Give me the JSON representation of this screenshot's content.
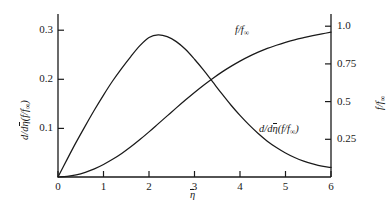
{
  "figure": {
    "background_color": "#ffffff",
    "line_color": "#1a1a1a",
    "axis_color": "#1a1a1a"
  },
  "axes": {
    "x": {
      "label_main": "η",
      "label_full": "η̄",
      "ticks": [
        "0",
        "1",
        "2",
        "3",
        "4",
        "5",
        "6"
      ],
      "min": 0,
      "max": 6
    },
    "y_left": {
      "label_prefix": "d/d",
      "label_eta": "η",
      "label_suffix": "(f/f",
      "label_sub": "∞",
      "label_close": ")",
      "label_full": "d/dη̄(f/f∞)",
      "ticks": [
        "0.1",
        "0.2",
        "0.3"
      ],
      "min": 0,
      "max": 0.36
    },
    "y_right": {
      "label_num": "f",
      "label_den": "f",
      "label_sub": "∞",
      "label_full": "f/f∞",
      "ticks": [
        "0.25",
        "0.5",
        "0.75",
        "1.0"
      ],
      "min": 0,
      "max": 1.08
    }
  },
  "curve_labels": {
    "f_over_finf": "f/f∞",
    "derivative": "d/dη̄(f/f∞)"
  },
  "chart_data": {
    "type": "line",
    "title": "",
    "xlabel": "η̄",
    "ylabel": "d/dη̄(f/f∞)",
    "ylabel_right": "f/f∞",
    "xlim": [
      0,
      6
    ],
    "ylim": [
      0,
      0.36
    ],
    "ylim_right": [
      0,
      1.08
    ],
    "grid": false,
    "legend": "inline-annotations",
    "xticks": [
      0,
      1,
      2,
      3,
      4,
      5,
      6
    ],
    "yticks_left": [
      0.1,
      0.2,
      0.3
    ],
    "yticks_right": [
      0.25,
      0.5,
      0.75,
      1.0
    ],
    "series": [
      {
        "name": "d/dη̄(f/f∞)",
        "axis": "left",
        "x": [
          0,
          0.2,
          0.4,
          0.6,
          0.8,
          1.0,
          1.2,
          1.4,
          1.6,
          1.8,
          2.0,
          2.2,
          2.4,
          2.6,
          2.8,
          3.0,
          3.2,
          3.4,
          3.6,
          3.8,
          4.0,
          4.2,
          4.4,
          4.6,
          4.8,
          5.0,
          5.2,
          5.4,
          5.6,
          5.8,
          6.0
        ],
        "values": [
          0.0,
          0.039,
          0.077,
          0.113,
          0.148,
          0.181,
          0.212,
          0.24,
          0.266,
          0.29,
          0.308,
          0.314,
          0.31,
          0.299,
          0.282,
          0.26,
          0.236,
          0.21,
          0.184,
          0.159,
          0.136,
          0.115,
          0.096,
          0.079,
          0.065,
          0.053,
          0.043,
          0.035,
          0.029,
          0.024,
          0.021
        ]
      },
      {
        "name": "f/f∞",
        "axis": "right",
        "x": [
          0,
          0.2,
          0.4,
          0.6,
          0.8,
          1.0,
          1.2,
          1.4,
          1.6,
          1.8,
          2.0,
          2.2,
          2.4,
          2.6,
          2.8,
          3.0,
          3.2,
          3.4,
          3.6,
          3.8,
          4.0,
          4.2,
          4.4,
          4.6,
          4.8,
          5.0,
          5.2,
          5.4,
          5.6,
          5.8,
          6.0
        ],
        "values": [
          0.0,
          0.004,
          0.014,
          0.031,
          0.054,
          0.083,
          0.117,
          0.156,
          0.2,
          0.248,
          0.299,
          0.352,
          0.405,
          0.458,
          0.51,
          0.56,
          0.608,
          0.653,
          0.695,
          0.733,
          0.768,
          0.799,
          0.827,
          0.852,
          0.873,
          0.892,
          0.909,
          0.923,
          0.936,
          0.948,
          0.96
        ]
      }
    ],
    "annotations": [
      {
        "text": "f/f∞",
        "x": 3.85,
        "y_right": 1.03
      },
      {
        "text": "d/dη̄(f/f∞)",
        "x": 4.55,
        "y_left": 0.115
      }
    ]
  }
}
